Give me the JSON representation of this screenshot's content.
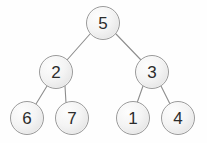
{
  "figure": {
    "background_color": "#fefefe",
    "width": 207,
    "height": 143
  },
  "style": {
    "node_fill_light": "#fdfdfd",
    "node_fill_dark": "#dcdcdc",
    "node_border_color": "#9a9a9a",
    "node_border_width": 1.2,
    "node_radius": 17,
    "label_color": "#2c2c2c",
    "label_font_size": 17,
    "edge_color": "#8d8d8d",
    "edge_width": 1.1
  },
  "tree": {
    "nodes": [
      {
        "id": "n5",
        "label": "5",
        "cx": 103,
        "cy": 23,
        "r": 17,
        "level": 0,
        "role": "root"
      },
      {
        "id": "n2",
        "label": "2",
        "cx": 56,
        "cy": 72,
        "r": 17,
        "level": 1,
        "role": "internal"
      },
      {
        "id": "n3",
        "label": "3",
        "cx": 152,
        "cy": 72,
        "r": 17,
        "level": 1,
        "role": "internal"
      },
      {
        "id": "n6",
        "label": "6",
        "cx": 27,
        "cy": 118,
        "r": 17,
        "level": 2,
        "role": "leaf"
      },
      {
        "id": "n7",
        "label": "7",
        "cx": 72,
        "cy": 118,
        "r": 17,
        "level": 2,
        "role": "leaf"
      },
      {
        "id": "n1",
        "label": "1",
        "cx": 133,
        "cy": 118,
        "r": 17,
        "level": 2,
        "role": "leaf"
      },
      {
        "id": "n4",
        "label": "4",
        "cx": 178,
        "cy": 118,
        "r": 17,
        "level": 2,
        "role": "leaf"
      }
    ],
    "edges": [
      {
        "id": "e5-2",
        "from": "n5",
        "to": "n2",
        "x1": 90,
        "y1": 34,
        "x2": 67,
        "y2": 60
      },
      {
        "id": "e5-3",
        "from": "n5",
        "to": "n3",
        "x1": 116,
        "y1": 34,
        "x2": 141,
        "y2": 60
      },
      {
        "id": "e2-6",
        "from": "n2",
        "to": "n6",
        "x1": 47,
        "y1": 86,
        "x2": 36,
        "y2": 104
      },
      {
        "id": "e2-7",
        "from": "n2",
        "to": "n7",
        "x1": 65,
        "y1": 86,
        "x2": 66,
        "y2": 103
      },
      {
        "id": "e3-1",
        "from": "n3",
        "to": "n1",
        "x1": 143,
        "y1": 86,
        "x2": 137,
        "y2": 103
      },
      {
        "id": "e3-4",
        "from": "n3",
        "to": "n4",
        "x1": 161,
        "y1": 86,
        "x2": 170,
        "y2": 104
      }
    ]
  }
}
